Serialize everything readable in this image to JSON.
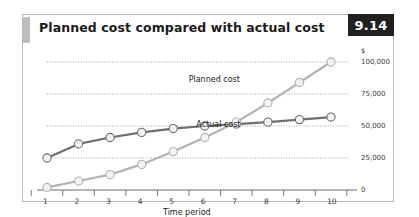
{
  "figure": {
    "title": "Planned cost compared with actual cost",
    "number": "9.14"
  },
  "chart_data": {
    "type": "line",
    "title": "Planned cost compared with actual cost",
    "xlabel": "Time period",
    "ylabel": "",
    "yunit": "$",
    "x": [
      1,
      2,
      3,
      4,
      5,
      6,
      7,
      8,
      9,
      10
    ],
    "xticklabels": [
      "1",
      "2",
      "3",
      "4",
      "5",
      "6",
      "7",
      "8",
      "9",
      "10"
    ],
    "yticks": [
      0,
      25000,
      50000,
      75000,
      100000
    ],
    "yticklabels": [
      "0",
      "25,000",
      "50,000",
      "75,000",
      "100,000"
    ],
    "ylim": [
      0,
      100000
    ],
    "xlim": [
      1,
      10
    ],
    "grid": "horizontal-dotted",
    "legend": "inline-annotations",
    "marker": "open-circle",
    "series": [
      {
        "name": "Actual cost",
        "color": "#6f6f6f",
        "values": [
          25000,
          36000,
          41000,
          45000,
          48000,
          50000,
          51500,
          53000,
          55000,
          57000
        ]
      },
      {
        "name": "Planned cost",
        "color": "#b3b3b3",
        "values": [
          2000,
          7000,
          12000,
          20000,
          30000,
          41000,
          53000,
          68000,
          84000,
          100000
        ]
      }
    ],
    "annotations": [
      {
        "text": "Planned cost",
        "x": 7.2,
        "y": 86000
      },
      {
        "text": "Actual cost",
        "x": 7.3,
        "y": 51000
      }
    ]
  },
  "axis": {
    "unit_symbol": "$",
    "x_title": "Time period"
  }
}
